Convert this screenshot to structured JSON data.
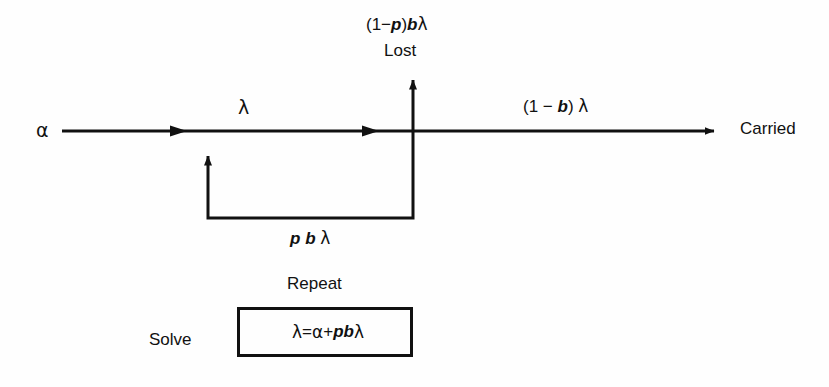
{
  "figure": {
    "background_color": "#fefefe",
    "line_color": "#111111",
    "type": "flow-diagram"
  },
  "labels": {
    "alpha_source": "α",
    "lambda_main": "λ",
    "lost_rate": "(1−p)bλ",
    "lost": "Lost",
    "carried_rate": "(1 − b) λ",
    "carried": "Carried",
    "feedback_rate": "p b λ",
    "repeat": "Repeat",
    "solve": "Solve",
    "equation": "λ = α + pbλ"
  },
  "chart_data": {
    "type": "diagram",
    "title": "",
    "nodes": [
      {
        "name": "alpha-source",
        "label": "α",
        "x": 42,
        "y": 131
      },
      {
        "name": "junction",
        "label": "",
        "x": 413,
        "y": 131
      },
      {
        "name": "lost-sink",
        "label": "Lost",
        "x": 413,
        "y": 52
      },
      {
        "name": "carried-sink",
        "label": "Carried",
        "x": 760,
        "y": 131
      }
    ],
    "edges": [
      {
        "name": "input-flow",
        "from": "alpha-source",
        "to": "junction",
        "label": "λ"
      },
      {
        "name": "lost-flow",
        "from": "junction",
        "to": "lost-sink",
        "label": "(1−p)bλ"
      },
      {
        "name": "carried-flow",
        "from": "junction",
        "to": "carried-sink",
        "label": "(1 − b) λ"
      },
      {
        "name": "feedback-flow",
        "from": "junction",
        "to": "input-flow",
        "label": "p b λ"
      }
    ],
    "annotations": [
      "Repeat",
      "Solve",
      "λ = α + pbλ"
    ]
  }
}
